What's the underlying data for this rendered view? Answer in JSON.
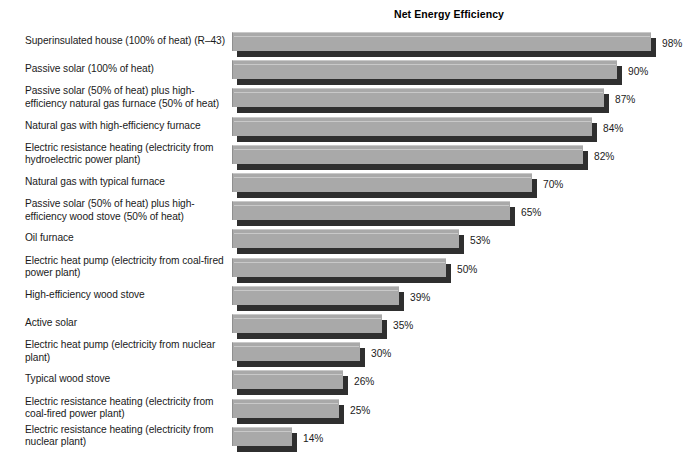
{
  "chart_data": {
    "type": "bar",
    "title": "Net Energy Efficiency",
    "xlabel": "",
    "ylabel": "",
    "orientation": "horizontal",
    "grid": false,
    "legend": "none",
    "xlim": [
      0,
      100
    ],
    "value_suffix": "%",
    "categories": [
      "Superinsulated house (100% of heat) (R–43)",
      "Passive solar (100% of heat)",
      "Passive solar (50% of heat) plus high-efficiency natural gas furnace (50% of heat)",
      "Natural gas with high-efficiency furnace",
      "Electric resistance heating (electricity from hydroelectric power plant)",
      "Natural gas with typical furnace",
      "Passive solar (50% of heat) plus high-efficiency wood stove (50% of heat)",
      "Oil furnace",
      "Electric heat pump (electricity from coal-fired power plant)",
      "High-efficiency wood stove",
      "Active solar",
      "Electric heat pump (electricity from nuclear plant)",
      "Typical wood stove",
      "Electric resistance heating (electricity from coal-fired power plant)",
      "Electric resistance heating (electricity from nuclear plant)"
    ],
    "values": [
      98,
      90,
      87,
      84,
      82,
      70,
      65,
      53,
      50,
      39,
      35,
      30,
      26,
      25,
      14
    ],
    "value_labels": [
      "98%",
      "90%",
      "87%",
      "84%",
      "82%",
      "70%",
      "65%",
      "53%",
      "50%",
      "39%",
      "35%",
      "30%",
      "26%",
      "25%",
      "14%"
    ],
    "colors": {
      "bar_face": "#a9a9a9",
      "bar_shadow": "#2f2f2f",
      "background": "#ffffff",
      "text": "#1a1a1a"
    }
  },
  "rows": [
    {
      "label_line1": "Superinsulated house (100% of heat) (R–43)",
      "label_line2": "",
      "value": "98%"
    },
    {
      "label_line1": "Passive solar (100% of heat)",
      "label_line2": "",
      "value": "90%"
    },
    {
      "label_line1": "Passive solar (50% of heat) plus high-",
      "label_line2": "efficiency natural gas furnace (50% of heat)",
      "value": "87%"
    },
    {
      "label_line1": "Natural gas with high-efficiency furnace",
      "label_line2": "",
      "value": "84%"
    },
    {
      "label_line1": "Electric resistance heating (electricity from",
      "label_line2": "hydroelectric power plant)",
      "value": "82%"
    },
    {
      "label_line1": "Natural gas with typical furnace",
      "label_line2": "",
      "value": "70%"
    },
    {
      "label_line1": "Passive solar (50% of heat) plus high-",
      "label_line2": "efficiency wood stove (50% of heat)",
      "value": "65%"
    },
    {
      "label_line1": "Oil furnace",
      "label_line2": "",
      "value": "53%"
    },
    {
      "label_line1": "Electric heat pump (electricity from coal-fired",
      "label_line2": "power plant)",
      "value": "50%"
    },
    {
      "label_line1": "High-efficiency wood stove",
      "label_line2": "",
      "value": "39%"
    },
    {
      "label_line1": "Active solar",
      "label_line2": "",
      "value": "35%"
    },
    {
      "label_line1": "Electric heat pump (electricity from nuclear",
      "label_line2": "plant)",
      "value": "30%"
    },
    {
      "label_line1": "Typical wood stove",
      "label_line2": "",
      "value": "26%"
    },
    {
      "label_line1": "Electric resistance heating (electricity from",
      "label_line2": "coal-fired power plant)",
      "value": "25%"
    },
    {
      "label_line1": "Electric resistance heating (electricity from",
      "label_line2": "nuclear plant)",
      "value": "14%"
    }
  ],
  "geometry": {
    "bar_origin_x": 237,
    "px_per_percent": 4.28,
    "first_bar_top": 32,
    "row_pitch": 28.2,
    "bar_height": 19,
    "depth": 5
  }
}
